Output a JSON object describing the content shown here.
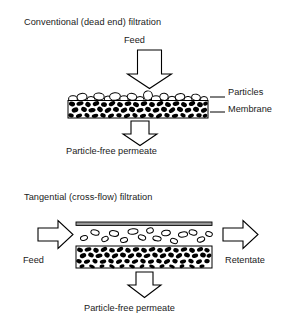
{
  "figure": {
    "kind": "process-diagram",
    "background_color": "#ffffff",
    "ink_color": "#000000",
    "panels": [
      {
        "id": "dead-end",
        "title": "Conventional (dead end) filtration",
        "inlet_label": "Feed",
        "outlet_label": "Particle-free permeate",
        "callouts": [
          {
            "id": "particles",
            "label": "Particles"
          },
          {
            "id": "membrane",
            "label": "Membrane"
          }
        ],
        "arrows": [
          {
            "id": "feed-arrow",
            "direction": "down"
          },
          {
            "id": "permeate-arrow",
            "direction": "down"
          }
        ]
      },
      {
        "id": "cross-flow",
        "title": "Tangential (cross-flow) filtration",
        "inlet_label": "Feed",
        "retentate_label": "Retentate",
        "outlet_label": "Particle-free permeate",
        "arrows": [
          {
            "id": "feed-arrow",
            "direction": "right"
          },
          {
            "id": "retentate-arrow",
            "direction": "right"
          },
          {
            "id": "permeate-arrow",
            "direction": "down"
          }
        ]
      }
    ]
  }
}
